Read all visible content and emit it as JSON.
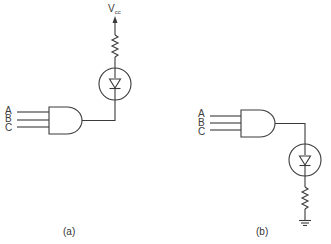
{
  "figure": {
    "panels": [
      {
        "id": "a",
        "caption": "(a)",
        "inputs": [
          "A",
          "B",
          "C"
        ],
        "gate": "AND",
        "supply_label": "V",
        "supply_subscript": "cc",
        "description": "LED and resistor connected from Vcc to AND gate output (current sinking)"
      },
      {
        "id": "b",
        "caption": "(b)",
        "inputs": [
          "A",
          "B",
          "C"
        ],
        "gate": "AND",
        "description": "LED and resistor connected from AND gate output to ground (current sourcing)"
      }
    ]
  },
  "colors": {
    "line": "#3a3a3a",
    "background": "#ffffff"
  }
}
